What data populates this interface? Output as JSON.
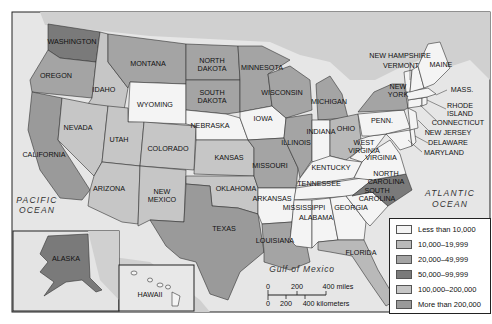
{
  "colors": {
    "sea": "#e6e6e6",
    "canada": "#d0d0d0",
    "bin0": "#f4f4f4",
    "bin1": "#b9b9b9",
    "bin2": "#a4a4a4",
    "bin3": "#7a7a7a",
    "bin4": "#c6c6c6",
    "bin5": "#9a9a9a"
  },
  "legend": {
    "items": [
      {
        "label": "Less than 10,000",
        "bin": "bin0"
      },
      {
        "label": "10,000–19,999",
        "bin": "bin1"
      },
      {
        "label": "20,000–49,999",
        "bin": "bin2"
      },
      {
        "label": "50,000–99,999",
        "bin": "bin3"
      },
      {
        "label": "100,000–200,000",
        "bin": "bin4"
      },
      {
        "label": "More than 200,000",
        "bin": "bin5"
      }
    ]
  },
  "water_labels": {
    "pacific_1": "PACIFIC",
    "pacific_2": "OCEAN",
    "atlantic_1": "ATLANTIC",
    "atlantic_2": "OCEAN",
    "gulf": "Gulf of Mexico"
  },
  "scale_bar": {
    "miles_ticks": [
      "0",
      "200",
      "400 miles"
    ],
    "km_ticks": [
      "0",
      "200",
      "400 kilometers"
    ]
  },
  "states": {
    "washington": {
      "label": "WASHINGTON",
      "bin": "bin3"
    },
    "oregon": {
      "label": "OREGON",
      "bin": "bin2"
    },
    "california": {
      "label": "CALIFORNIA",
      "bin": "bin5"
    },
    "idaho": {
      "label": "IDAHO",
      "bin": "bin4"
    },
    "nevada": {
      "label": "NEVADA",
      "bin": "bin4"
    },
    "montana": {
      "label": "MONTANA",
      "bin": "bin2"
    },
    "wyoming": {
      "label": "WYOMING",
      "bin": "bin0"
    },
    "utah": {
      "label": "UTAH",
      "bin": "bin4"
    },
    "arizona": {
      "label": "ARIZONA",
      "bin": "bin4"
    },
    "colorado": {
      "label": "COLORADO",
      "bin": "bin4"
    },
    "new_mexico": {
      "label": "NEW MEXICO",
      "bin": "bin4"
    },
    "north_dakota": {
      "label": "NORTH DAKOTA",
      "bin": "bin2"
    },
    "south_dakota": {
      "label": "SOUTH DAKOTA",
      "bin": "bin2"
    },
    "nebraska": {
      "label": "NEBRASKA",
      "bin": "bin0"
    },
    "kansas": {
      "label": "KANSAS",
      "bin": "bin4"
    },
    "oklahoma": {
      "label": "OKLAHOMA",
      "bin": "bin4"
    },
    "texas": {
      "label": "TEXAS",
      "bin": "bin5"
    },
    "minnesota": {
      "label": "MINNESOTA",
      "bin": "bin2"
    },
    "iowa": {
      "label": "IOWA",
      "bin": "bin0"
    },
    "missouri": {
      "label": "MISSOURI",
      "bin": "bin2"
    },
    "arkansas": {
      "label": "ARKANSAS",
      "bin": "bin0"
    },
    "louisiana": {
      "label": "LOUISIANA",
      "bin": "bin2"
    },
    "wisconsin": {
      "label": "WISCONSIN",
      "bin": "bin2"
    },
    "illinois": {
      "label": "ILLINOIS",
      "bin": "bin2"
    },
    "michigan": {
      "label": "MICHIGAN",
      "bin": "bin2"
    },
    "indiana": {
      "label": "INDIANA",
      "bin": "bin0"
    },
    "ohio": {
      "label": "OHIO",
      "bin": "bin1"
    },
    "kentucky": {
      "label": "KENTUCKY",
      "bin": "bin0"
    },
    "tennessee": {
      "label": "TENNESSEE",
      "bin": "bin0"
    },
    "mississippi": {
      "label": "MISSISSIPPI",
      "bin": "bin0"
    },
    "alabama": {
      "label": "ALABAMA",
      "bin": "bin0"
    },
    "georgia": {
      "label": "GEORGIA",
      "bin": "bin0"
    },
    "florida": {
      "label": "FLORIDA",
      "bin": "bin1"
    },
    "south_carolina": {
      "label": "SOUTH CAROLINA",
      "bin": "bin0"
    },
    "north_carolina": {
      "label": "NORTH CAROLINA",
      "bin": "bin3"
    },
    "virginia": {
      "label": "VIRGINIA",
      "bin": "bin0"
    },
    "west_virginia": {
      "label": "WEST VIRGINIA",
      "bin": "bin0"
    },
    "pennsylvania": {
      "label": "PENN.",
      "bin": "bin0"
    },
    "new_york": {
      "label": "NEW YORK",
      "bin": "bin2"
    },
    "maryland": {
      "label": "MARYLAND",
      "bin": "bin0"
    },
    "delaware": {
      "label": "DELAWARE",
      "bin": "bin0"
    },
    "new_jersey": {
      "label": "NEW JERSEY",
      "bin": "bin0"
    },
    "connecticut": {
      "label": "CONNECTICUT",
      "bin": "bin0"
    },
    "rhode_island": {
      "label": "RHODE ISLAND",
      "bin": "bin0"
    },
    "massachusetts": {
      "label": "MASS.",
      "bin": "bin0"
    },
    "vermont": {
      "label": "VERMONT",
      "bin": "bin0"
    },
    "new_hampshire": {
      "label": "NEW HAMPSHIRE",
      "bin": "bin0"
    },
    "maine": {
      "label": "MAINE",
      "bin": "bin0"
    },
    "alaska": {
      "label": "ALASKA",
      "bin": "bin3"
    },
    "hawaii": {
      "label": "HAWAII",
      "bin": "bin0"
    }
  }
}
